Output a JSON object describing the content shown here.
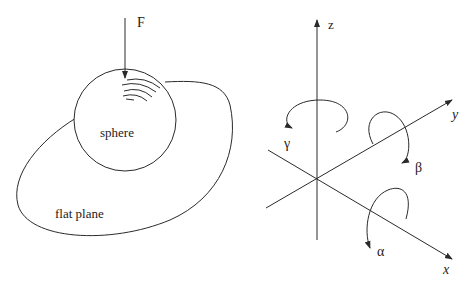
{
  "left_panel": {
    "force_label": "F",
    "sphere_label": "sphere",
    "plane_label": "flat plane"
  },
  "right_panel": {
    "axes": {
      "z": "z",
      "y": "y",
      "x": "x"
    },
    "rotations": {
      "gamma": "γ",
      "beta": "β",
      "alpha": "α"
    }
  },
  "colors": {
    "ink": "#2a2a2a",
    "background": "#ffffff"
  }
}
